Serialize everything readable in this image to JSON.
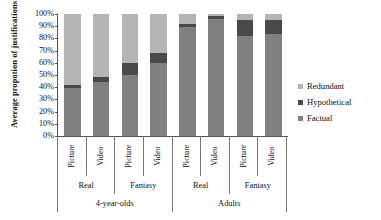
{
  "chart_data": {
    "type": "bar",
    "title": "",
    "subtype": "stacked-percentage-column",
    "xlabel": "",
    "ylabel": "Average propotion of justifications",
    "ylim": [
      0,
      100
    ],
    "y_tick_labels": [
      "100%",
      "90%",
      "80%",
      "70%",
      "60%",
      "50%",
      "40%",
      "30%",
      "20%",
      "10%",
      "0%"
    ],
    "y_tick_values": [
      100,
      90,
      80,
      70,
      60,
      50,
      40,
      30,
      20,
      10,
      0
    ],
    "grid": false,
    "legend_position": "right",
    "categories": [
      "4-year-olds / Real / Picture",
      "4-year-olds / Real / Video",
      "4-year-olds / Fantasy / Picture",
      "4-year-olds / Fantasy / Video",
      "Adults / Real / Picture",
      "Adults / Real / Video",
      "Adults / Fantasy / Picture",
      "Adults / Fantasy / Video"
    ],
    "series": [
      {
        "name": "Factual",
        "color": "#808080",
        "values": [
          39,
          44,
          50,
          60,
          89,
          96,
          82,
          84
        ]
      },
      {
        "name": "Hypothetical",
        "color": "#494949",
        "values": [
          3,
          4,
          10,
          8,
          3,
          2,
          13,
          11
        ]
      },
      {
        "name": "Redundant",
        "color": "#b5b5b5",
        "values": [
          58,
          52,
          40,
          32,
          8,
          2,
          5,
          5
        ]
      }
    ]
  },
  "axis": {
    "media_labels": [
      "Picture",
      "Video",
      "Picture",
      "Video",
      "Picture",
      "Video",
      "Picture",
      "Video"
    ],
    "world_labels": [
      "Real",
      "Fantasy",
      "Real",
      "Fantasy"
    ],
    "age_labels": [
      "4-year-olds",
      "Adults"
    ]
  },
  "legend": {
    "items": [
      {
        "label": "Redundant",
        "color": "#b5b5b5"
      },
      {
        "label": "Hypothetical",
        "color": "#494949"
      },
      {
        "label": "Factual",
        "color": "#808080"
      }
    ]
  }
}
